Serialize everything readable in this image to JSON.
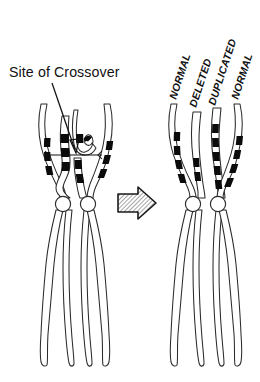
{
  "figure": {
    "background_color": "#ffffff",
    "ink_color": "#111111",
    "band_color": "#0b0b0b",
    "width": 260,
    "height": 382
  },
  "annotations": {
    "crossover_caption": "Site of Crossover",
    "leader_name": "crossover-pointer-line",
    "measure_name": "crossover-span-marker"
  },
  "left_panel": {
    "name": "before-crossover-panel",
    "description": "Paired homologous chromosomes with chromatids crossing over",
    "centromere_count": 2,
    "chromosome_count": 2
  },
  "transition": {
    "arrow_label": "right-arrow",
    "direction": "right",
    "style": "hatched-block-arrow"
  },
  "right_panel": {
    "name": "after-crossover-panel",
    "description": "Resulting chromatids after crossover",
    "centromere_count": 2,
    "chromosome_count": 2,
    "labels": [
      {
        "text": "NORMAL",
        "chromatid_index": 1
      },
      {
        "text": "DELETED",
        "chromatid_index": 2
      },
      {
        "text": "DUPLICATED",
        "chromatid_index": 3
      },
      {
        "text": "NORMAL",
        "chromatid_index": 4
      }
    ]
  },
  "band_patterns": {
    "normal_left": [
      128,
      140,
      152,
      166,
      180
    ],
    "deleted": [
      160,
      172,
      184
    ],
    "duplicated": [
      124,
      136,
      148,
      160,
      172,
      184,
      196
    ],
    "normal_right": [
      132,
      144,
      156,
      170,
      184
    ]
  },
  "footer": {
    "cropped_text": ""
  }
}
